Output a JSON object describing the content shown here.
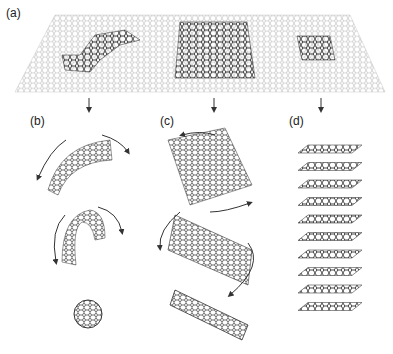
{
  "panels": [
    {
      "id": "a",
      "label": "(a)",
      "description": "graphene sheet with highlighted regions"
    },
    {
      "id": "b",
      "label": "(b)",
      "description": "fullerene wrapping"
    },
    {
      "id": "c",
      "label": "(c)",
      "description": "nanotube rolling"
    },
    {
      "id": "d",
      "label": "(d)",
      "description": "graphite stacking"
    }
  ],
  "graphite_layers": 10,
  "colors": {
    "sheet": "#9a9a9a",
    "highlight": "#333333",
    "arrow": "#333333"
  }
}
